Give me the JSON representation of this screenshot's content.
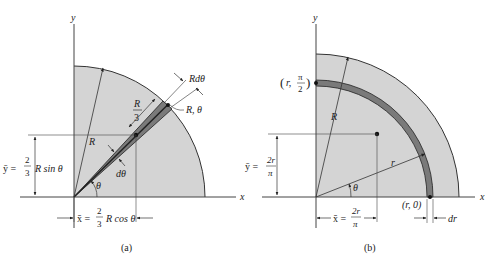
{
  "colors": {
    "fill": "#d4d4d4",
    "element": "#7a7a7a",
    "ink": "#222222",
    "background": "#ffffff"
  },
  "panel_a": {
    "caption": "(a)",
    "axis_x": "x",
    "axis_y": "y",
    "radius_label": "R",
    "element_length_label_num": "R",
    "element_length_label_den": "3",
    "element_width_label": "Rdθ",
    "tip_point_label": "R, θ",
    "dtheta_label": "dθ",
    "theta_label": "θ",
    "ybar_prefix": "ȳ =",
    "ybar_frac_num": "2",
    "ybar_frac_den": "3",
    "ybar_suffix": "R sin θ",
    "xbar_prefix": "x̄ =",
    "xbar_frac_num": "2",
    "xbar_frac_den": "3",
    "xbar_suffix": "R cos θ"
  },
  "panel_b": {
    "caption": "(b)",
    "axis_x": "x",
    "axis_y": "y",
    "radius_label": "R",
    "ring_radius_label": "r",
    "theta_label": "θ",
    "top_point_label_left": "(r,",
    "top_point_label_num": "π",
    "top_point_label_den": "2",
    "top_point_label_right": ")",
    "right_point_label": "(r, 0)",
    "dr_label": "dr",
    "ybar_prefix": "ȳ =",
    "ybar_frac_num": "2r",
    "ybar_frac_den": "π",
    "xbar_prefix": "x̄ =",
    "xbar_frac_num": "2r",
    "xbar_frac_den": "π"
  }
}
